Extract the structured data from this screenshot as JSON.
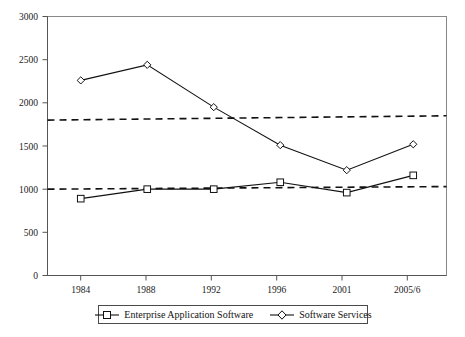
{
  "chart_data": {
    "type": "line",
    "title": "",
    "subtitle": "",
    "xlabel": "",
    "ylabel": "",
    "categories": [
      "1984",
      "1988",
      "1992",
      "1996",
      "2001",
      "2005/6"
    ],
    "ylim": [
      0,
      3000
    ],
    "yticks": [
      0,
      500,
      1000,
      1500,
      2000,
      2500,
      3000
    ],
    "ytick_labels": [
      "0",
      "500",
      "1000",
      "1500",
      "2000",
      "2500",
      "3000"
    ],
    "grid": false,
    "legend_position": "bottom",
    "series": [
      {
        "name": "Enterprise Application Software",
        "marker": "square",
        "values": [
          890,
          1000,
          1000,
          1080,
          960,
          1160
        ]
      },
      {
        "name": "Software Services",
        "marker": "diamond",
        "values": [
          2260,
          2440,
          1950,
          1510,
          1220,
          1520
        ]
      }
    ],
    "trendlines": [
      {
        "name": "Software Services trend",
        "style": "dashed",
        "start_value": 1800,
        "end_value": 1850
      },
      {
        "name": "Enterprise Application Software trend",
        "style": "dashed",
        "start_value": 1000,
        "end_value": 1030
      }
    ]
  },
  "legend": {
    "items": [
      {
        "label": "Enterprise Application Software",
        "marker": "square"
      },
      {
        "label": "Software Services",
        "marker": "diamond"
      }
    ]
  },
  "axis": {
    "y_labels": [
      "3000",
      "2500",
      "2000",
      "1500",
      "1000",
      "500",
      "0"
    ],
    "x_labels": [
      "1984",
      "1988",
      "1992",
      "1996",
      "2001",
      "2005/6"
    ]
  },
  "colors": {
    "series": "#111111",
    "axis": "#555555",
    "border": "#888888",
    "background": "#ffffff"
  }
}
